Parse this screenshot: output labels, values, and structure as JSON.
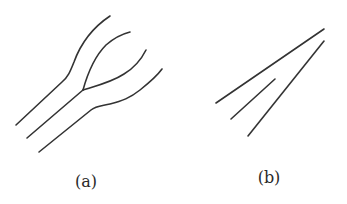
{
  "figure": {
    "panels": [
      {
        "id": "a",
        "label": "(a)",
        "description": "Three parallel curved lines where the middle line splits into a Y-shaped branch"
      },
      {
        "id": "b",
        "label": "(b)",
        "description": "Three straight converging line segments"
      }
    ],
    "stroke_color": "#333333",
    "background": "#ffffff"
  }
}
